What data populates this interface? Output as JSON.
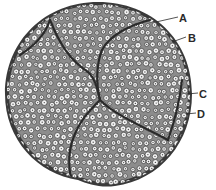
{
  "figure": {
    "colors": {
      "ink": "#2a2a2a",
      "fascicle_fill": "#9a9a9a",
      "axon_fill": "#f2f2f2",
      "background": "#ffffff"
    }
  },
  "labels": [
    {
      "id": "A",
      "text": "A"
    },
    {
      "id": "B",
      "text": "B"
    },
    {
      "id": "C",
      "text": "C"
    },
    {
      "id": "D",
      "text": "D"
    }
  ]
}
